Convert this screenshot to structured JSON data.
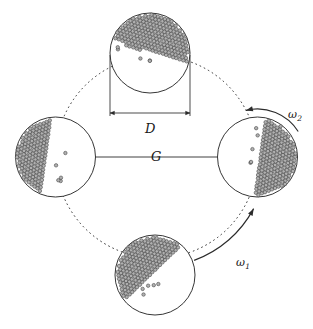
{
  "figure": {
    "type": "diagram",
    "width": 313,
    "height": 329,
    "background_color": "#ffffff",
    "line_color": "#2b2b2b",
    "particle_fill": "#b0b0b0",
    "particle_stroke": "#3c3c3c"
  },
  "labels": {
    "diameter": "D",
    "revolution_radius": "G",
    "omega_rotation": "ω",
    "omega_rotation_sub": "2",
    "omega_revolution": "ω",
    "omega_revolution_sub": "1"
  },
  "label_positions": {
    "diameter": {
      "x": 145,
      "y": 122
    },
    "revolution_radius": {
      "x": 151,
      "y": 150
    },
    "omega_rotation": {
      "x": 288,
      "y": 109
    },
    "omega_revolution": {
      "x": 236,
      "y": 257
    }
  },
  "orbit": {
    "center_x": 156.5,
    "center_y": 157,
    "radius": 101,
    "dash": "1.6 3.0",
    "stroke_width": 1.0
  },
  "center_line": {
    "x1": 55.5,
    "y1": 157,
    "x2": 257.5,
    "y2": 157,
    "stroke_width": 0.9
  },
  "dimension": {
    "extension_left_x": 110,
    "extension_right_x": 190,
    "extension_top_y": 55,
    "line_y": 113,
    "arrow_size": 4.5
  },
  "jars": [
    {
      "name": "top-jar",
      "cx": 150,
      "cy": 53,
      "r": 40,
      "fill_angle_deg": 108,
      "fill_offset": -0.04,
      "rows": 23
    },
    {
      "name": "left-jar",
      "cx": 55.5,
      "cy": 157,
      "r": 40,
      "fill_angle_deg": 8,
      "fill_offset": 0.22,
      "rows": 23
    },
    {
      "name": "right-jar",
      "cx": 257.5,
      "cy": 157,
      "r": 40,
      "fill_angle_deg": 188,
      "fill_offset": 0.04,
      "rows": 23
    },
    {
      "name": "bottom-jar",
      "cx": 155,
      "cy": 275,
      "r": 40,
      "fill_angle_deg": 46,
      "fill_offset": 0.05,
      "rows": 23
    }
  ],
  "particles": {
    "diameter": 3.45,
    "spacing": 3.55,
    "surface_roughness": 2.1,
    "stray_count": 5
  },
  "arrows": {
    "rotation_arc": {
      "name": "omega2-arc",
      "cx": 257.5,
      "cy": 157,
      "r": 48,
      "start_deg": -32,
      "end_deg": -104,
      "direction": "counterclockwise"
    },
    "revolution_arc": {
      "name": "omega1-arc",
      "cx": 156.5,
      "cy": 157,
      "r": 110,
      "start_deg": 70,
      "end_deg": 28,
      "direction": "counterclockwise"
    }
  }
}
